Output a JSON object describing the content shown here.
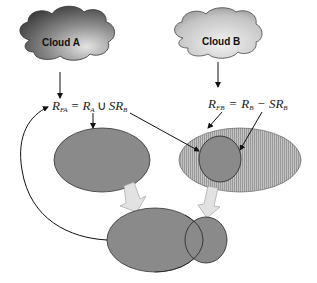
{
  "diagram": {
    "clouds": [
      {
        "id": "cloud-a",
        "label": "Cloud A"
      },
      {
        "id": "cloud-b",
        "label": "Cloud B"
      }
    ],
    "formulas": {
      "fa": {
        "lhs": "R",
        "lhs_sub": "FA",
        "eq": "=",
        "r": "R",
        "r_sub": "A",
        "op": "∪",
        "sr": "SR",
        "sr_sub": "B"
      },
      "fb": {
        "lhs": "R",
        "lhs_sub": "FB",
        "eq": "=",
        "r": "R",
        "r_sub": "B",
        "op": "−",
        "sr": "SR",
        "sr_sub": "B"
      }
    },
    "colors": {
      "cloud_dark": "#3a3a3a",
      "cloud_light": "#d8d8d8",
      "ellipse_fill": "#8a8a8a",
      "hatched_fill": "#b8b8b8",
      "block_arrow": "#e2e2e2",
      "stroke": "#222222"
    }
  }
}
